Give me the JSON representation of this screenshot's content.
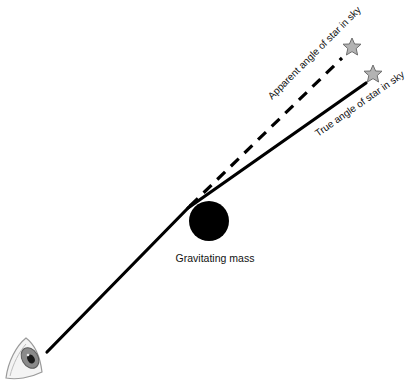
{
  "diagram": {
    "labels": {
      "apparent": "Apparent angle of star in sky",
      "true": "True angle of star in sky",
      "mass": "Gravitating mass"
    },
    "elements": {
      "observer": "eye-icon",
      "mass": "black-circle",
      "apparent_star": "star-icon",
      "true_star": "star-icon"
    },
    "colors": {
      "line": "#000000",
      "mass": "#000000",
      "star_fill": "#b3b3b3",
      "star_stroke": "#6e6e6e",
      "text": "#111111"
    }
  }
}
